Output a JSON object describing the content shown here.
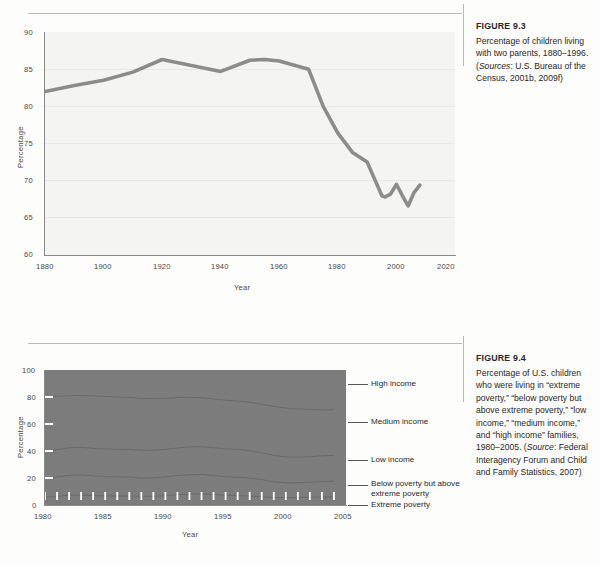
{
  "figures": [
    {
      "number": "FIGURE 9.3",
      "caption_parts": {
        "p1": "Percentage of children living with two parents, 1880–1996. (",
        "em1": "Sources",
        "p2": ": U.S. Bureau of the Census, 2001b, 2009f)"
      }
    },
    {
      "number": "FIGURE 9.4",
      "caption_parts": {
        "p1": "Percentage of U.S. children who were living in “extreme poverty,” “below poverty but above extreme poverty,” “low income,” “medium income,” and “high income” families, 1980–2005. (",
        "em1": "Source",
        "p2": ": Federal Interagency Forum and Child and Family Statistics, 2007)"
      }
    }
  ],
  "chart_data": [
    {
      "type": "line",
      "title": "Percentage of children living with two parents",
      "xlabel": "Year",
      "ylabel": "Percentage",
      "xlim": [
        1880,
        2020
      ],
      "ylim": [
        60,
        90
      ],
      "xticks": [
        1880,
        1900,
        1920,
        1940,
        1960,
        1980,
        2000,
        2020
      ],
      "yticks": [
        60,
        65,
        70,
        75,
        80,
        85,
        90
      ],
      "grid": "horizontal",
      "line_color": "#8c8c8c",
      "series": [
        {
          "name": "Children living with two parents",
          "x": [
            1880,
            1890,
            1900,
            1910,
            1920,
            1930,
            1940,
            1950,
            1955,
            1960,
            1970,
            1975,
            1980,
            1985,
            1990,
            1993,
            1995,
            1996,
            1998,
            2000,
            2002,
            2004,
            2006,
            2008
          ],
          "values": [
            82.0,
            82.8,
            83.5,
            84.6,
            86.3,
            85.5,
            84.7,
            86.2,
            86.3,
            86.1,
            85.0,
            80.0,
            76.4,
            73.8,
            72.5,
            69.8,
            68.0,
            67.8,
            68.2,
            69.5,
            68.0,
            66.6,
            68.4,
            69.4
          ]
        }
      ]
    },
    {
      "type": "area",
      "title": "Percentage of U.S. children by family income category",
      "xlabel": "Year",
      "ylabel": "Percentage",
      "xlim": [
        1980,
        2005
      ],
      "ylim": [
        0,
        100
      ],
      "xticks": [
        1980,
        1985,
        1990,
        1995,
        2000,
        2005
      ],
      "yticks": [
        0,
        20,
        40,
        60,
        80,
        100
      ],
      "grid": "none",
      "fill_color": "#7c7c7c",
      "x": [
        1980,
        1981,
        1982,
        1983,
        1984,
        1985,
        1986,
        1987,
        1988,
        1989,
        1990,
        1991,
        1992,
        1993,
        1994,
        1995,
        1996,
        1997,
        1998,
        1999,
        2000,
        2001,
        2002,
        2003,
        2004
      ],
      "boundaries": [
        {
          "name": "Extreme poverty",
          "values": [
            6.0,
            6.5,
            7.2,
            7.4,
            7.0,
            6.8,
            6.6,
            6.6,
            6.5,
            6.4,
            7.0,
            7.6,
            8.0,
            8.2,
            7.8,
            7.2,
            7.0,
            6.6,
            6.0,
            5.6,
            5.4,
            5.6,
            5.8,
            6.0,
            6.0
          ]
        },
        {
          "name": "Below poverty but above extreme poverty",
          "values": [
            19.5,
            20.8,
            22.0,
            22.3,
            21.6,
            21.0,
            20.8,
            20.7,
            20.0,
            20.0,
            20.8,
            21.9,
            22.4,
            22.7,
            21.9,
            20.9,
            20.6,
            19.9,
            18.8,
            17.2,
            16.4,
            16.5,
            16.9,
            17.4,
            17.6
          ]
        },
        {
          "name": "Low income",
          "values": [
            40.0,
            41.0,
            42.4,
            42.7,
            42.0,
            41.6,
            41.2,
            41.2,
            40.6,
            40.5,
            41.2,
            42.3,
            43.0,
            43.2,
            42.4,
            41.6,
            41.2,
            40.2,
            38.6,
            36.8,
            35.6,
            35.4,
            35.8,
            36.4,
            36.8
          ]
        },
        {
          "name": "Medium income",
          "values": [
            79.6,
            80.4,
            81.0,
            81.2,
            80.8,
            80.4,
            80.0,
            79.6,
            79.0,
            78.8,
            79.0,
            79.6,
            79.8,
            79.4,
            78.6,
            77.6,
            77.0,
            76.0,
            74.6,
            73.0,
            71.8,
            71.2,
            70.8,
            70.4,
            70.6
          ]
        },
        {
          "name": "High income",
          "values": [
            100,
            100,
            100,
            100,
            100,
            100,
            100,
            100,
            100,
            100,
            100,
            100,
            100,
            100,
            100,
            100,
            100,
            100,
            100,
            100,
            100,
            100,
            100,
            100,
            100
          ]
        }
      ],
      "legend": [
        {
          "label": "High income",
          "y_value": 82
        },
        {
          "label": "Medium income",
          "y_value": 54
        },
        {
          "label": "Low income",
          "y_value": 28
        },
        {
          "label": "Below poverty but above extreme poverty",
          "y_value": 15
        },
        {
          "label": "Extreme poverty",
          "y_value": 3
        }
      ]
    }
  ]
}
